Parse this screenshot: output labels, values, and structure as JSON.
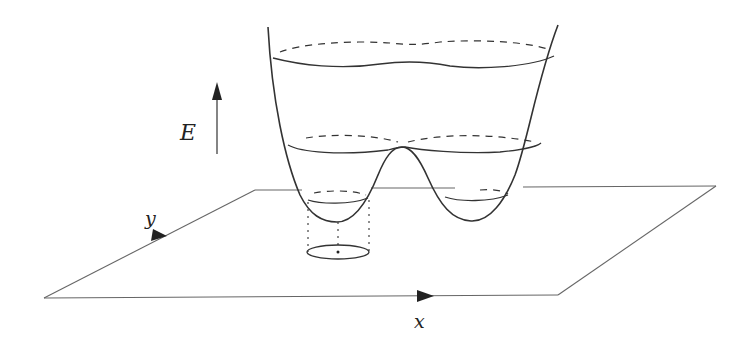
{
  "figure": {
    "type": "potential-energy-surface",
    "labels": {
      "energy_axis": "E",
      "x_axis": "x",
      "y_axis": "y"
    },
    "colors": {
      "line": "#333333",
      "plane": "#555555",
      "background": "#ffffff"
    },
    "energy_levels": [
      {
        "name": "high",
        "style": "solid-front, dashed-back"
      },
      {
        "name": "saddle",
        "style": "solid-front, dashed-back"
      },
      {
        "name": "low-left-well",
        "style": "solid-front, dashed-back"
      },
      {
        "name": "low-right-well",
        "style": "solid-front, dashed-back"
      }
    ],
    "projection": "dotted projection of left-well contour onto x-y plane as ellipse"
  }
}
